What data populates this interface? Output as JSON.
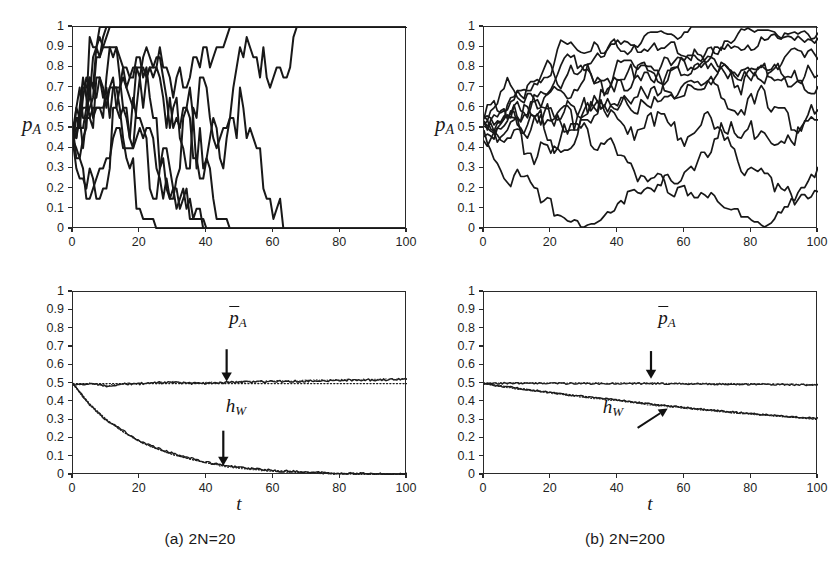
{
  "figure": {
    "background": "#ffffff",
    "ink_color": "#1a1a1a",
    "panel_captions": [
      {
        "id": "a",
        "text": "(a)  2N=20",
        "prefix": "(a)",
        "italic_part": "N",
        "full": "(a)  2N=20"
      },
      {
        "id": "b",
        "text": "(b)  2N=200",
        "prefix": "(b)",
        "italic_part": "N",
        "full": "(b)  2N=200"
      }
    ],
    "bottom_note": ""
  },
  "chart_data": [
    {
      "id": "panel-a-top",
      "type": "line",
      "title": "",
      "xlabel": "",
      "ylabel": "p_A",
      "ylabel_display": "p",
      "ylabel_sub": "A",
      "xlim": [
        0,
        100
      ],
      "ylim": [
        0,
        1
      ],
      "grid": false,
      "legend": "none",
      "xticks": [
        0,
        20,
        40,
        60,
        80,
        100
      ],
      "xtick_labels": [
        "0",
        "20",
        "40",
        "60",
        "80",
        "100"
      ],
      "yticks": [
        0,
        0.1,
        0.2,
        0.3,
        0.4,
        0.5,
        0.6,
        0.7,
        0.8,
        0.9,
        1
      ],
      "ytick_labels": [
        "0",
        "0.1",
        "0.2",
        "0.3",
        "0.4",
        "0.5",
        "0.6",
        "0.7",
        "0.8",
        "0.9",
        "1"
      ],
      "description": "Ten Wright-Fisher allele-frequency sample paths for population size 2N=20; all paths fix at 0 or 1 within t<80.",
      "population_2N": 20,
      "n_replicates": 10,
      "step_sd": 0.112,
      "seed": 1771,
      "series_note": "simulated binomial drift, p0=0.5, absorbing at 0 and 1"
    },
    {
      "id": "panel-b-top",
      "type": "line",
      "title": "",
      "xlabel": "",
      "ylabel": "p_A",
      "ylabel_display": "p",
      "ylabel_sub": "A",
      "xlim": [
        0,
        100
      ],
      "ylim": [
        0,
        1
      ],
      "grid": false,
      "legend": "none",
      "xticks": [
        0,
        20,
        40,
        60,
        80,
        100
      ],
      "xtick_labels": [
        "0",
        "20",
        "40",
        "60",
        "80",
        "100"
      ],
      "yticks": [
        0,
        0.1,
        0.2,
        0.3,
        0.4,
        0.5,
        0.6,
        0.7,
        0.8,
        0.9,
        1
      ],
      "ytick_labels": [
        "0",
        "0.1",
        "0.2",
        "0.3",
        "0.4",
        "0.5",
        "0.6",
        "0.7",
        "0.8",
        "0.9",
        "1"
      ],
      "description": "Ten Wright-Fisher allele-frequency sample paths for population size 2N=200; paths wander slowly, one fixes at 0 near t=52.",
      "population_2N": 200,
      "n_replicates": 10,
      "step_sd": 0.0354,
      "seed": 9043,
      "series_note": "simulated binomial drift, p0=0.5, absorbing at 0 and 1"
    },
    {
      "id": "panel-a-bottom",
      "type": "line",
      "title": "",
      "xlabel": "t",
      "ylabel": "",
      "xlim": [
        0,
        100
      ],
      "ylim": [
        0,
        1
      ],
      "grid": false,
      "legend": "none",
      "xticks": [
        0,
        20,
        40,
        60,
        80,
        100
      ],
      "xtick_labels": [
        "0",
        "20",
        "40",
        "60",
        "80",
        "100"
      ],
      "yticks": [
        0,
        0.1,
        0.2,
        0.3,
        0.4,
        0.5,
        0.6,
        0.7,
        0.8,
        0.9,
        1
      ],
      "ytick_labels": [
        "0",
        "0.1",
        "0.2",
        "0.3",
        "0.4",
        "0.5",
        "0.6",
        "0.7",
        "0.8",
        "0.9",
        "1"
      ],
      "population_2N": 20,
      "series": [
        {
          "name": "p_A_bar",
          "label_display": "p",
          "label_sub": "A",
          "style": "solid+dotted",
          "annotation": "p̄_A",
          "x": [
            0,
            5,
            10,
            15,
            20,
            25,
            30,
            35,
            40,
            45,
            50,
            55,
            60,
            65,
            70,
            75,
            80,
            85,
            90,
            95,
            100
          ],
          "values": [
            0.492,
            0.498,
            0.487,
            0.497,
            0.499,
            0.503,
            0.506,
            0.5,
            0.502,
            0.505,
            0.508,
            0.509,
            0.511,
            0.512,
            0.514,
            0.516,
            0.518,
            0.519,
            0.52,
            0.521,
            0.522
          ]
        },
        {
          "name": "p_A_bar_theory",
          "style": "dotted",
          "x": [
            0,
            20,
            40,
            60,
            80,
            100
          ],
          "values": [
            0.5,
            0.5,
            0.5,
            0.5,
            0.5,
            0.5
          ]
        },
        {
          "name": "h_W",
          "label_display": "h",
          "label_sub": "W",
          "style": "solid+dotted",
          "annotation": "h_W",
          "decay_rate_per_t": 0.05,
          "x": [
            0,
            5,
            10,
            15,
            20,
            25,
            30,
            35,
            40,
            45,
            50,
            55,
            60,
            65,
            70,
            75,
            80,
            85,
            90,
            95,
            100
          ],
          "values": [
            0.5,
            0.385,
            0.3,
            0.242,
            0.185,
            0.148,
            0.117,
            0.092,
            0.069,
            0.052,
            0.04,
            0.031,
            0.024,
            0.019,
            0.015,
            0.012,
            0.009,
            0.007,
            0.006,
            0.005,
            0.004
          ]
        },
        {
          "name": "h_W_theory",
          "style": "dotted",
          "x": [
            0,
            5,
            10,
            15,
            20,
            25,
            30,
            35,
            40,
            45,
            50,
            55,
            60,
            65,
            70,
            75,
            80,
            85,
            90,
            95,
            100
          ],
          "values": [
            0.5,
            0.389,
            0.303,
            0.236,
            0.184,
            0.143,
            0.111,
            0.087,
            0.067,
            0.053,
            0.041,
            0.032,
            0.025,
            0.019,
            0.015,
            0.012,
            0.009,
            0.007,
            0.006,
            0.004,
            0.003
          ]
        }
      ],
      "annotations": [
        {
          "text": "p̄_A",
          "arrow": "down",
          "x": 46,
          "y_label": 0.72,
          "y_target": 0.505
        },
        {
          "text": "h_W",
          "arrow": "down",
          "x": 45,
          "y_label": 0.275,
          "y_target": 0.045
        }
      ]
    },
    {
      "id": "panel-b-bottom",
      "type": "line",
      "title": "",
      "xlabel": "t",
      "ylabel": "",
      "xlim": [
        0,
        100
      ],
      "ylim": [
        0,
        1
      ],
      "grid": false,
      "legend": "none",
      "xticks": [
        0,
        20,
        40,
        60,
        80,
        100
      ],
      "xtick_labels": [
        "0",
        "20",
        "40",
        "60",
        "80",
        "100"
      ],
      "yticks": [
        0,
        0.1,
        0.2,
        0.3,
        0.4,
        0.5,
        0.6,
        0.7,
        0.8,
        0.9,
        1
      ],
      "ytick_labels": [
        "0",
        "0.1",
        "0.2",
        "0.3",
        "0.4",
        "0.5",
        "0.6",
        "0.7",
        "0.8",
        "0.9",
        "1"
      ],
      "population_2N": 200,
      "series": [
        {
          "name": "p_A_bar",
          "label_display": "p",
          "label_sub": "A",
          "style": "solid+dotted",
          "annotation": "p̄_A",
          "x": [
            0,
            10,
            20,
            30,
            40,
            50,
            60,
            70,
            80,
            90,
            100
          ],
          "values": [
            0.5,
            0.502,
            0.501,
            0.5,
            0.499,
            0.5,
            0.498,
            0.497,
            0.496,
            0.494,
            0.492
          ]
        },
        {
          "name": "h_W",
          "label_display": "h",
          "label_sub": "W",
          "style": "solid+dotted",
          "annotation": "h_W",
          "decay_rate_per_t": 0.005,
          "x": [
            0,
            10,
            20,
            30,
            40,
            50,
            60,
            70,
            80,
            90,
            100
          ],
          "values": [
            0.5,
            0.474,
            0.451,
            0.428,
            0.409,
            0.387,
            0.369,
            0.351,
            0.335,
            0.322,
            0.311
          ]
        },
        {
          "name": "h_W_theory",
          "style": "dotted",
          "x": [
            0,
            10,
            20,
            30,
            40,
            50,
            60,
            70,
            80,
            90,
            100
          ],
          "values": [
            0.5,
            0.475,
            0.452,
            0.43,
            0.409,
            0.389,
            0.37,
            0.352,
            0.335,
            0.319,
            0.303
          ]
        }
      ],
      "annotations": [
        {
          "text": "p̄_A",
          "arrow": "down",
          "x": 50,
          "y_label": 0.71,
          "y_target": 0.52
        },
        {
          "text": "h_W",
          "arrow": "up-right",
          "x": 43,
          "y_label": 0.225,
          "y_target": 0.375
        }
      ]
    }
  ]
}
